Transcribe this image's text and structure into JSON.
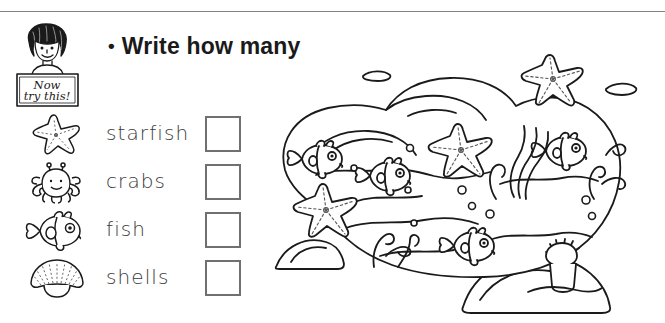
{
  "page": {
    "background_color": "#ffffff",
    "ink_color": "#1a1a1a",
    "rule_color": "#808080"
  },
  "mascot": {
    "name": "girl-with-sign",
    "sign_line_1": "Now",
    "sign_line_2": "try this!",
    "description": "smiling girl with curly dark hair holding a hand-lettered placard"
  },
  "heading": {
    "bullet": "•",
    "text": "Write how many"
  },
  "items": [
    {
      "icon": "starfish-icon",
      "label": "starfish",
      "answer": ""
    },
    {
      "icon": "crab-icon",
      "label": "crabs",
      "answer": ""
    },
    {
      "icon": "fish-icon",
      "label": "fish",
      "answer": ""
    },
    {
      "icon": "shell-icon",
      "label": "shells",
      "answer": ""
    }
  ],
  "scene": {
    "name": "rock-pool-illustration",
    "description": "black and white line drawing of a rock pool seen from above with fish, starfish, seaweed, coral, an anemone, bubbles and surrounding rocks",
    "contents": {
      "fish": 4,
      "starfish": 3,
      "crabs": 0,
      "shells": 0,
      "seaweed": 1,
      "coral": 3,
      "anemone": 1,
      "bubbles": 9,
      "rocks": 3,
      "pebbles": 2
    }
  }
}
